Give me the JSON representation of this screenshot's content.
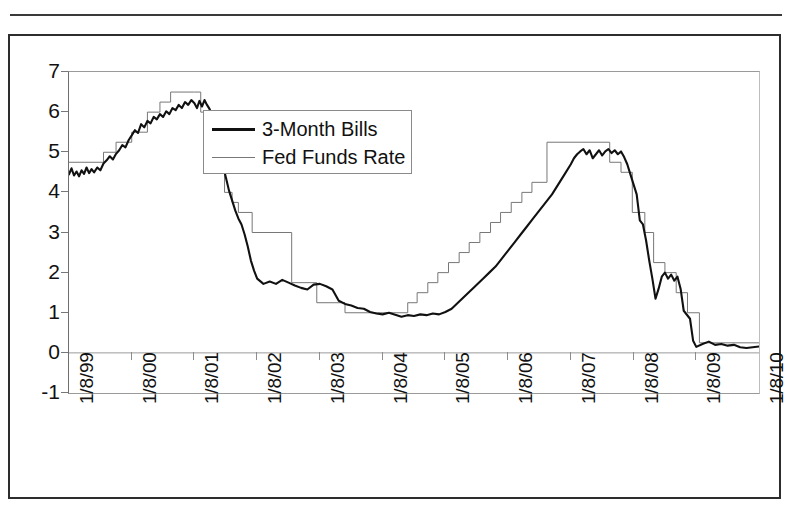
{
  "figure": {
    "caption_ghost": "descenders only",
    "has_outer_frame": true
  },
  "chart_data": {
    "type": "line",
    "title": "",
    "subtitle": "",
    "xlabel": "",
    "ylabel": "",
    "grid": false,
    "legend_position": "inside-upper-left-center",
    "ylim": [
      -1,
      7
    ],
    "yticks": [
      7,
      6,
      5,
      4,
      3,
      2,
      1,
      0,
      -1
    ],
    "ytick_labels": [
      "7",
      "6",
      "5",
      "4",
      "3",
      "2",
      "1",
      "0",
      "-1"
    ],
    "xtick_labels": [
      "1/8/99",
      "1/8/00",
      "1/8/01",
      "1/8/02",
      "1/8/03",
      "1/8/04",
      "1/8/05",
      "1/8/06",
      "1/8/07",
      "1/8/08",
      "1/8/09",
      "1/8/10"
    ],
    "xlim_labels": [
      "1/8/99",
      "1/8/10"
    ],
    "zero_line": 0,
    "series": [
      {
        "name": "3-Month Bills",
        "style": "solid-thick",
        "color": "#111111",
        "linewidth": 2.1,
        "x": [
          0.0,
          0.04,
          0.08,
          0.12,
          0.16,
          0.2,
          0.24,
          0.28,
          0.32,
          0.36,
          0.4,
          0.45,
          0.5,
          0.55,
          0.6,
          0.65,
          0.7,
          0.75,
          0.8,
          0.85,
          0.9,
          0.95,
          1.0,
          1.05,
          1.1,
          1.15,
          1.2,
          1.25,
          1.3,
          1.35,
          1.4,
          1.45,
          1.5,
          1.55,
          1.6,
          1.65,
          1.7,
          1.75,
          1.8,
          1.85,
          1.9,
          1.95,
          2.0,
          2.04,
          2.08,
          2.12,
          2.16,
          2.2,
          2.24,
          2.28,
          2.32,
          2.36,
          2.4,
          2.45,
          2.5,
          2.55,
          2.6,
          2.65,
          2.7,
          2.75,
          2.8,
          2.85,
          2.9,
          2.95,
          3.0,
          3.1,
          3.2,
          3.3,
          3.4,
          3.5,
          3.6,
          3.7,
          3.8,
          3.9,
          4.0,
          4.1,
          4.2,
          4.3,
          4.4,
          4.5,
          4.6,
          4.7,
          4.8,
          4.9,
          5.0,
          5.1,
          5.2,
          5.3,
          5.4,
          5.5,
          5.6,
          5.7,
          5.8,
          5.9,
          6.0,
          6.1,
          6.2,
          6.3,
          6.4,
          6.5,
          6.6,
          6.7,
          6.8,
          6.9,
          7.0,
          7.1,
          7.2,
          7.3,
          7.4,
          7.5,
          7.6,
          7.7,
          7.8,
          7.9,
          8.0,
          8.05,
          8.1,
          8.15,
          8.2,
          8.25,
          8.3,
          8.35,
          8.4,
          8.45,
          8.5,
          8.55,
          8.6,
          8.65,
          8.7,
          8.75,
          8.8,
          8.85,
          8.9,
          8.95,
          9.0,
          9.05,
          9.1,
          9.15,
          9.2,
          9.25,
          9.3,
          9.35,
          9.4,
          9.45,
          9.5,
          9.55,
          9.6,
          9.65,
          9.7,
          9.75,
          9.8,
          9.85,
          9.9,
          9.95,
          10.0,
          10.1,
          10.2,
          10.3,
          10.4,
          10.5,
          10.6,
          10.7,
          10.8,
          10.9,
          11.0
        ],
        "y": [
          4.45,
          4.6,
          4.42,
          4.52,
          4.4,
          4.55,
          4.46,
          4.62,
          4.48,
          4.58,
          4.5,
          4.62,
          4.55,
          4.72,
          4.8,
          4.9,
          4.82,
          4.96,
          5.05,
          5.18,
          5.12,
          5.3,
          5.42,
          5.55,
          5.48,
          5.7,
          5.62,
          5.78,
          5.72,
          5.88,
          5.82,
          5.95,
          5.88,
          6.02,
          5.95,
          6.1,
          6.05,
          6.18,
          6.1,
          6.25,
          6.18,
          6.3,
          6.22,
          6.1,
          6.28,
          6.14,
          6.3,
          6.18,
          6.08,
          5.95,
          5.7,
          5.4,
          5.05,
          4.7,
          4.38,
          4.05,
          3.8,
          3.55,
          3.35,
          3.2,
          2.95,
          2.65,
          2.3,
          2.05,
          1.85,
          1.72,
          1.78,
          1.72,
          1.82,
          1.75,
          1.68,
          1.62,
          1.58,
          1.7,
          1.72,
          1.66,
          1.58,
          1.3,
          1.22,
          1.18,
          1.12,
          1.1,
          1.02,
          0.98,
          0.96,
          1.0,
          0.95,
          0.9,
          0.94,
          0.92,
          0.96,
          0.94,
          0.98,
          0.96,
          1.02,
          1.1,
          1.25,
          1.4,
          1.55,
          1.7,
          1.85,
          2.0,
          2.15,
          2.35,
          2.55,
          2.75,
          2.95,
          3.15,
          3.35,
          3.55,
          3.75,
          3.95,
          4.2,
          4.45,
          4.7,
          4.85,
          4.95,
          5.02,
          5.08,
          4.95,
          5.05,
          4.85,
          4.95,
          5.05,
          4.92,
          5.02,
          5.08,
          4.98,
          5.05,
          4.95,
          5.02,
          4.88,
          4.7,
          4.45,
          4.2,
          3.95,
          3.3,
          3.2,
          2.8,
          2.3,
          1.85,
          1.35,
          1.6,
          1.9,
          2.0,
          1.85,
          1.95,
          1.8,
          1.9,
          1.6,
          1.05,
          0.95,
          0.85,
          0.3,
          0.15,
          0.22,
          0.28,
          0.2,
          0.22,
          0.18,
          0.2,
          0.14,
          0.12,
          0.14,
          0.16
        ]
      },
      {
        "name": "Fed Funds Rate",
        "style": "step-thin",
        "color": "#777777",
        "linewidth": 1,
        "steps_x": [
          0.0,
          0.55,
          0.75,
          1.0,
          1.25,
          1.45,
          1.62,
          2.0,
          2.1,
          2.2,
          2.28,
          2.38,
          2.48,
          2.6,
          2.7,
          2.92,
          3.55,
          3.95,
          4.4,
          5.4,
          5.55,
          5.72,
          5.88,
          6.05,
          6.22,
          6.38,
          6.55,
          6.72,
          6.88,
          7.05,
          7.22,
          7.38,
          7.62,
          8.62,
          8.8,
          8.98,
          9.18,
          9.32,
          9.5,
          9.68,
          9.86,
          10.05
        ],
        "steps_y": [
          4.75,
          5.0,
          5.25,
          5.5,
          6.0,
          6.25,
          6.5,
          6.5,
          6.0,
          5.5,
          5.0,
          4.5,
          4.0,
          3.75,
          3.5,
          3.0,
          1.75,
          1.25,
          1.0,
          1.25,
          1.5,
          1.75,
          2.0,
          2.25,
          2.5,
          2.75,
          3.0,
          3.25,
          3.5,
          3.75,
          4.0,
          4.25,
          5.25,
          4.75,
          4.5,
          3.5,
          3.0,
          2.25,
          2.0,
          1.5,
          1.0,
          0.25
        ]
      }
    ],
    "annotations": [
      {
        "text": "peak Fed Funds Rate 6.50 in 2000-2001"
      },
      {
        "text": "trough near 1.00 in 2003-2004"
      },
      {
        "text": "plateau 5.25 in 2006-2007"
      },
      {
        "text": "near-zero 0.25 from 2009"
      }
    ]
  },
  "legend": {
    "entries": [
      {
        "label": "3-Month Bills",
        "swatch": "thick-black-line"
      },
      {
        "label": "Fed Funds Rate",
        "swatch": "thin-gray-line"
      }
    ]
  }
}
